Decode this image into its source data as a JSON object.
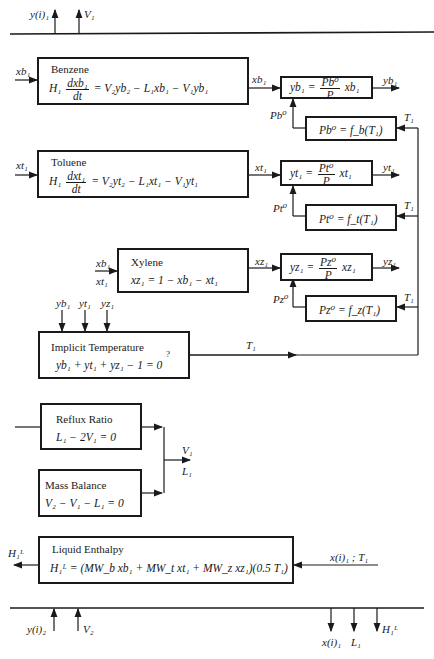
{
  "top_boundary": {
    "outputs": [
      "y(i)₁",
      "V₁"
    ]
  },
  "benzene": {
    "title": "Benzene",
    "input": "xb₁",
    "output": "xb₁",
    "equation_lhs": "H₁",
    "frac_num": "dxb₁",
    "frac_den": "dt",
    "equation_rhs": "= V₂yb₂ − L₁xb₁ − V₁yb₁"
  },
  "benzene_eq": {
    "lhs": "yb₁ =",
    "frac_num": "Pb⁰",
    "frac_den": "P",
    "rhs": "xb₁",
    "output": "yb₁"
  },
  "benzene_vp": {
    "equation": "Pb⁰ = f_b(T₁)",
    "output_label": "Pb⁰",
    "input_label": "T₁"
  },
  "toluene": {
    "title": "Toluene",
    "input": "xt₁",
    "output": "xt₁",
    "equation_lhs": "H₁",
    "frac_num": "dxt₁",
    "frac_den": "dt",
    "equation_rhs": "= V₂yt₂ − L₁xt₁ − V₁yt₁"
  },
  "toluene_eq": {
    "lhs": "yt₁ =",
    "frac_num": "Pt⁰",
    "frac_den": "P",
    "rhs": "xt₁",
    "output": "yt₁"
  },
  "toluene_vp": {
    "equation": "Pt⁰ = f_t(T₁)",
    "output_label": "Pt⁰",
    "input_label": "T₁"
  },
  "xylene": {
    "title": "Xylene",
    "input_a": "xb₁",
    "input_b": "xt₁",
    "output": "xz₁",
    "equation": "xz₁ = 1 − xb₁ − xt₁"
  },
  "xylene_eq": {
    "lhs": "yz₁ =",
    "frac_num": "Pz⁰",
    "frac_den": "P",
    "rhs": "xz₁",
    "output": "yz₁"
  },
  "xylene_vp": {
    "equation": "Pz⁰ = f_z(T₁)",
    "output_label": "Pz⁰",
    "input_label": "T₁"
  },
  "implicit_temp": {
    "title": "Implicit Temperature",
    "inputs": [
      "yb₁",
      "yt₁",
      "yz₁"
    ],
    "equation": "yb₁ + yt₁ + yz₁ − 1 = 0",
    "question_mark": "?",
    "output": "T₁"
  },
  "reflux": {
    "title": "Reflux Ratio",
    "equation": "L₁ − 2V₁ = 0"
  },
  "mass_balance": {
    "title": "Mass Balance",
    "equation": "V₂ − V₁ − L₁ = 0"
  },
  "combined_outputs": [
    "V₁",
    "L₁"
  ],
  "liquid_enthalpy": {
    "title": "Liquid Enthalpy",
    "equation": "H₁ᴸ = (MW_b xb₁ + MW_t xt₁ + MW_z xz₁)(0.5 T₁)",
    "input": "x(i)₁ ; T₁",
    "output": "H₁ᴸ"
  },
  "bottom_boundary": {
    "inputs": [
      "y(i)₂",
      "V₂"
    ],
    "outputs": [
      "x(i)₁",
      "L₁",
      "H₁ᴸ"
    ]
  }
}
